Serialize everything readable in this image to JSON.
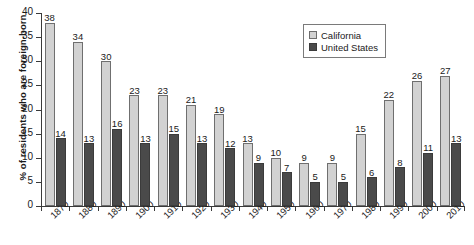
{
  "chart_data": {
    "type": "bar",
    "title": "",
    "subtitle": "",
    "xlabel": "",
    "ylabel": "% of residents who are foreign-born",
    "ylim": [
      0,
      40
    ],
    "ytick_values": [
      0,
      5,
      10,
      15,
      20,
      25,
      30,
      35,
      40
    ],
    "ytick_labels": [
      "0",
      "5",
      "10",
      "15",
      "20",
      "25",
      "30",
      "35",
      "40"
    ],
    "grid": false,
    "legend_position": "top-right",
    "data_labels": true,
    "categories": [
      "1870",
      "1880",
      "1890",
      "1900",
      "1910",
      "1920",
      "1930",
      "1940",
      "1950",
      "1960",
      "1970",
      "1980",
      "1990",
      "2000",
      "2010"
    ],
    "series": [
      {
        "name": "California",
        "color": "#d2d2d2",
        "values": [
          38,
          34,
          30,
          23,
          23,
          21,
          19,
          13,
          10,
          9,
          9,
          15,
          22,
          26,
          27
        ]
      },
      {
        "name": "United States",
        "color": "#4a4a4a",
        "values": [
          14,
          13,
          16,
          13,
          15,
          13,
          12,
          9,
          7,
          5,
          5,
          6,
          8,
          11,
          13
        ]
      }
    ]
  },
  "legend": {
    "items": [
      {
        "label": "California",
        "swatch": "ca"
      },
      {
        "label": "United States",
        "swatch": "us"
      }
    ]
  }
}
